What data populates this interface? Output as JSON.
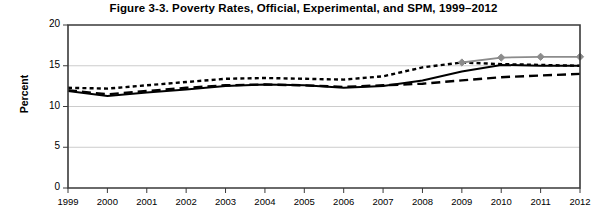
{
  "chart_data": {
    "type": "line",
    "title": "Figure 3-3. Poverty Rates, Official, Experimental, and SPM, 1999–2012",
    "xlabel": "",
    "ylabel": "Percent",
    "x": [
      1999,
      2000,
      2001,
      2002,
      2003,
      2004,
      2005,
      2006,
      2007,
      2008,
      2009,
      2010,
      2011,
      2012
    ],
    "categories": [
      "1999",
      "2000",
      "2001",
      "2002",
      "2003",
      "2004",
      "2005",
      "2006",
      "2007",
      "2008",
      "2009",
      "2010",
      "2011",
      "2012"
    ],
    "ylim": [
      0,
      20
    ],
    "yticks": [
      0,
      5,
      10,
      15,
      20
    ],
    "ytick_labels": [
      "0",
      "5",
      "10",
      "15",
      "20"
    ],
    "xlim": [
      1999,
      2012
    ],
    "grid": true,
    "legend_position": "none",
    "series": [
      {
        "name": "Official",
        "style": "solid",
        "color": "#000000",
        "values": [
          11.9,
          11.3,
          11.7,
          12.1,
          12.5,
          12.7,
          12.6,
          12.3,
          12.5,
          13.2,
          14.3,
          15.1,
          15.0,
          15.0
        ]
      },
      {
        "name": "Experimental",
        "style": "dotted",
        "color": "#000000",
        "values": [
          12.3,
          12.2,
          12.6,
          13.0,
          13.4,
          13.5,
          13.4,
          13.3,
          13.7,
          14.8,
          15.4,
          15.2,
          15.1,
          15.0
        ]
      },
      {
        "name": "Anchored",
        "style": "dashed",
        "color": "#000000",
        "values": [
          12.0,
          11.5,
          11.9,
          12.3,
          12.6,
          12.7,
          12.6,
          12.4,
          12.6,
          12.8,
          13.2,
          13.6,
          13.8,
          14.0
        ]
      },
      {
        "name": "SPM",
        "style": "solid-marker",
        "color": "#8c8c8c",
        "marker": "diamond",
        "values": [
          null,
          null,
          null,
          null,
          null,
          null,
          null,
          null,
          null,
          null,
          15.4,
          16.0,
          16.1,
          16.1
        ]
      }
    ]
  },
  "axes": {
    "plot_left": 68,
    "plot_right": 580,
    "plot_top": 25,
    "plot_bottom": 188
  }
}
